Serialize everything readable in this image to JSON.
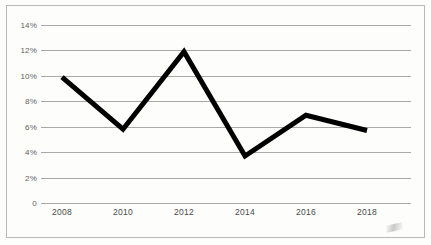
{
  "chart_data": {
    "type": "line",
    "title": "",
    "subtitle": "",
    "xlabel": "",
    "ylabel": "",
    "categories": [
      "2008",
      "2010",
      "2012",
      "2014",
      "2016",
      "2018"
    ],
    "x": [
      2008,
      2010,
      2012,
      2014,
      2016,
      2018
    ],
    "values": [
      9.9,
      5.8,
      11.9,
      3.7,
      6.9,
      5.7
    ],
    "series": [
      {
        "name": "",
        "values": [
          9.9,
          5.8,
          11.9,
          3.7,
          6.9,
          5.7
        ],
        "color": "#000000"
      }
    ],
    "ylim": [
      0,
      14
    ],
    "yticks": [
      0,
      2,
      4,
      6,
      8,
      10,
      12,
      14
    ],
    "ytick_labels": [
      "0",
      "2%",
      "4%",
      "6%",
      "8%",
      "10%",
      "12%",
      "14%"
    ],
    "xtick_labels": [
      "2008",
      "2010",
      "2012",
      "2014",
      "2016",
      "2018"
    ],
    "grid": "horizontal",
    "legend": "none",
    "markers": "none",
    "annotations": []
  },
  "figure": {
    "background_color": "#fdfdfc",
    "border_color": "#b9b9b9",
    "gridline_color": "#a8a8a8",
    "line_color": "#000000",
    "ytick_label_color": "#5f5f5f",
    "xtick_label_color": "#4a4a4a"
  }
}
